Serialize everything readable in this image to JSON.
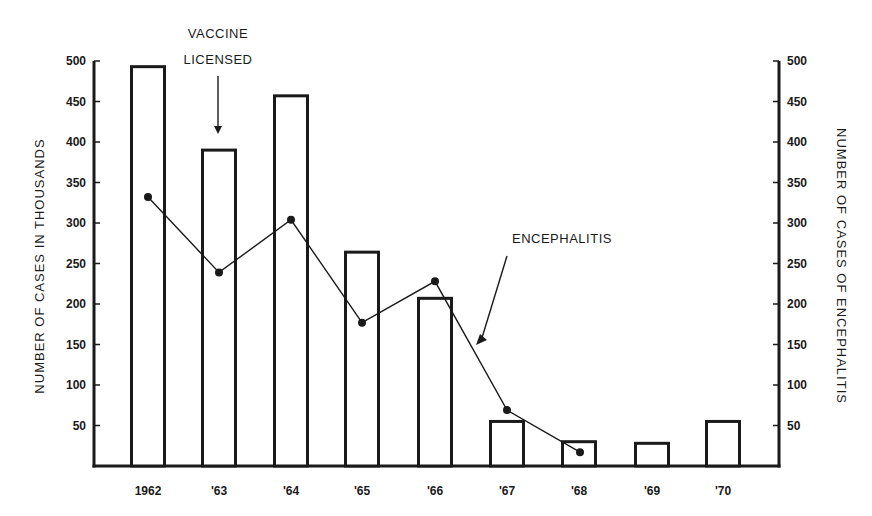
{
  "chart_data": {
    "type": "bar",
    "title": "",
    "categories": [
      "1962",
      "'63",
      "'64",
      "'65",
      "'66",
      "'67",
      "'68",
      "'69",
      "'70"
    ],
    "series": [
      {
        "name": "Number of cases (thousands)",
        "type": "bar",
        "axis": "left",
        "values": [
          493,
          390,
          457,
          264,
          207,
          55,
          30,
          28,
          55
        ]
      },
      {
        "name": "Encephalitis",
        "type": "line",
        "axis": "right",
        "values": [
          332,
          239,
          304,
          177,
          228,
          69,
          17,
          null,
          null
        ]
      }
    ],
    "xlabel": "",
    "ylabel": "NUMBER OF CASES IN THOUSANDS",
    "ylabel_right": "NUMBER OF CASES OF ENCEPHALITIS",
    "ylim": [
      0,
      500
    ],
    "ylim_right": [
      0,
      500
    ],
    "yticks": [
      50,
      100,
      150,
      200,
      250,
      300,
      350,
      400,
      450,
      500
    ],
    "grid": false,
    "legend": null,
    "annotations": [
      {
        "text": "VACCINE LICENSED",
        "points_to": "'63",
        "type": "arrow-down"
      },
      {
        "text": "ENCEPHALITIS",
        "points_to": "Encephalitis line between '66 and '67",
        "type": "arrow"
      }
    ]
  },
  "labels": {
    "y_left_title": "NUMBER   OF   CASES   IN   THOUSANDS",
    "y_right_title": "NUMBER   OF   CASES   OF   ENCEPHALITIS",
    "vaccine_line1": "VACCINE",
    "vaccine_line2": "LICENSED",
    "encephalitis": "ENCEPHALITIS",
    "ticks": [
      "50",
      "100",
      "150",
      "200",
      "250",
      "300",
      "350",
      "400",
      "450",
      "500"
    ],
    "categories": [
      "1962",
      "'63",
      "'64",
      "'65",
      "'66",
      "'67",
      "'68",
      "'69",
      "'70"
    ]
  },
  "colors": {
    "ink": "#1a1a1a",
    "background": "#ffffff"
  }
}
